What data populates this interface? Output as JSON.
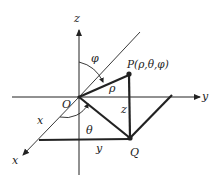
{
  "diagram": {
    "colors": {
      "stroke": "#222222",
      "background": "#ffffff"
    },
    "axes": {
      "x_label": "x",
      "y_label": "y",
      "z_label": "z"
    },
    "points": {
      "origin": "O",
      "P": "P(ρ,θ,φ)",
      "Q": "Q"
    },
    "segment_labels": {
      "rho": "ρ",
      "z": "z",
      "x": "x",
      "y": "y"
    },
    "angle_labels": {
      "phi": "φ",
      "theta": "θ"
    }
  }
}
